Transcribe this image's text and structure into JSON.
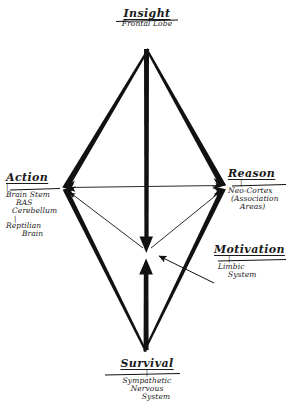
{
  "diagram": {
    "title_visible": false,
    "style": "hand-drawn ink sketch on white paper",
    "ink_color": "#111111",
    "paper_color": "#ffffff",
    "nodes": {
      "top": {
        "id": "insight",
        "title": "Insight",
        "subtitle_lines": [
          "Frontal Lobe"
        ],
        "position": "top vertex"
      },
      "left": {
        "id": "action",
        "title": "Action",
        "subtitle_lines": [
          "Brain Stem",
          "RAS",
          "Cerebellum"
        ],
        "subtitle_lines_2": [
          "Reptilian",
          "Brain"
        ],
        "position": "left vertex"
      },
      "right": {
        "id": "reason",
        "title": "Reason",
        "subtitle_lines": [
          "Neo-Cortex",
          "(Association",
          "Areas)"
        ],
        "position": "right vertex"
      },
      "bottom": {
        "id": "survival",
        "title": "Survival",
        "subtitle_lines": [
          "Sympathetic",
          "Nervous",
          "System"
        ],
        "position": "bottom vertex"
      },
      "center": {
        "id": "motivation",
        "title": "Motivation",
        "subtitle_lines": [
          "Limbic",
          "System"
        ],
        "position": "center point"
      }
    },
    "tick_mark": "|",
    "connections": [
      {
        "from": "insight",
        "to": "action",
        "style": "thick-tapered",
        "arrow": "to-action"
      },
      {
        "from": "insight",
        "to": "reason",
        "style": "thick-tapered",
        "arrow": "to-reason"
      },
      {
        "from": "survival",
        "to": "action",
        "style": "thick-tapered",
        "arrow": "to-action"
      },
      {
        "from": "survival",
        "to": "reason",
        "style": "thick-tapered",
        "arrow": "to-reason"
      },
      {
        "from": "action",
        "to": "reason",
        "style": "thin-double",
        "arrow": "both"
      },
      {
        "from": "insight",
        "to": "motivation",
        "style": "thick",
        "arrow": "down"
      },
      {
        "from": "survival",
        "to": "motivation",
        "style": "thick",
        "arrow": "up"
      },
      {
        "from": "motivation",
        "to": "action",
        "style": "thin",
        "arrow": "to-action"
      },
      {
        "from": "motivation",
        "to": "reason",
        "style": "thin",
        "arrow": "to-reason"
      },
      {
        "from": "motivation-label",
        "to": "motivation",
        "style": "thin-leader",
        "arrow": "to-center"
      }
    ]
  }
}
